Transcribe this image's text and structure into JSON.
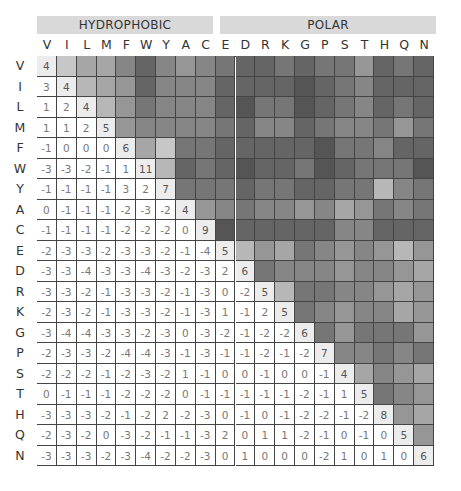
{
  "groups": [
    {
      "label": "HYDROPHOBIC",
      "start": 0,
      "end": 8
    },
    {
      "label": "POLAR",
      "start": 9,
      "end": 19
    }
  ],
  "chart_data": {
    "type": "heatmap",
    "group_labels": [
      "HYDROPHOBIC",
      "POLAR"
    ],
    "labels": [
      "V",
      "I",
      "L",
      "M",
      "F",
      "W",
      "Y",
      "A",
      "C",
      "E",
      "D",
      "R",
      "K",
      "G",
      "P",
      "S",
      "T",
      "H",
      "Q",
      "N"
    ],
    "lower_triangle_values": [
      [
        4
      ],
      [
        3,
        4
      ],
      [
        1,
        2,
        4
      ],
      [
        1,
        1,
        2,
        5
      ],
      [
        -1,
        0,
        0,
        0,
        6
      ],
      [
        -3,
        -3,
        -2,
        -1,
        1,
        11
      ],
      [
        -1,
        -1,
        -1,
        -1,
        3,
        2,
        7
      ],
      [
        0,
        -1,
        -1,
        -1,
        -2,
        -3,
        -2,
        4
      ],
      [
        -1,
        -1,
        -1,
        -1,
        -2,
        -2,
        -2,
        0,
        9
      ],
      [
        -2,
        -3,
        -3,
        -2,
        -3,
        -3,
        -2,
        -1,
        -4,
        5
      ],
      [
        -3,
        -3,
        -4,
        -3,
        -3,
        -4,
        -3,
        -2,
        -3,
        2,
        6
      ],
      [
        -3,
        -3,
        -2,
        -1,
        -3,
        -3,
        -2,
        -1,
        -3,
        0,
        -2,
        5
      ],
      [
        -2,
        -3,
        -2,
        -1,
        -3,
        -3,
        -2,
        -1,
        -3,
        1,
        -1,
        2,
        5
      ],
      [
        -3,
        -4,
        -4,
        -3,
        -3,
        -2,
        -3,
        0,
        -3,
        -2,
        -1,
        -2,
        -2,
        6
      ],
      [
        -2,
        -3,
        -3,
        -2,
        -4,
        -4,
        -3,
        -1,
        -3,
        -1,
        -1,
        -2,
        -1,
        -2,
        7
      ],
      [
        -2,
        -2,
        -2,
        -1,
        -2,
        -3,
        -2,
        1,
        -1,
        0,
        0,
        -1,
        0,
        0,
        -1,
        4
      ],
      [
        0,
        -1,
        -1,
        -1,
        -2,
        -2,
        -2,
        0,
        -1,
        -1,
        -1,
        -1,
        -1,
        -2,
        -1,
        1,
        5
      ],
      [
        -3,
        -3,
        -3,
        -2,
        -1,
        -2,
        2,
        -2,
        -3,
        0,
        -1,
        0,
        -1,
        -2,
        -2,
        -1,
        -2,
        8
      ],
      [
        -2,
        -3,
        -2,
        0,
        -3,
        -2,
        -1,
        -1,
        -3,
        2,
        0,
        1,
        1,
        -2,
        -1,
        0,
        -1,
        0,
        5
      ],
      [
        -3,
        -3,
        -3,
        -2,
        -3,
        -4,
        -2,
        -2,
        -3,
        0,
        1,
        0,
        0,
        0,
        -2,
        1,
        0,
        1,
        0,
        6
      ]
    ],
    "encoding": "lower triangle shows numeric scores; diagonal lightly shaded; upper triangle shaded grayscale (darker = lower score)",
    "value_range": [
      -4,
      11
    ]
  },
  "colors": {
    "band_bg": "#d9d9d9",
    "grid_line": "#444444",
    "diag_bg": "#ececec",
    "shade_light": "#e8e8e8",
    "shade_dark": "#555555"
  }
}
